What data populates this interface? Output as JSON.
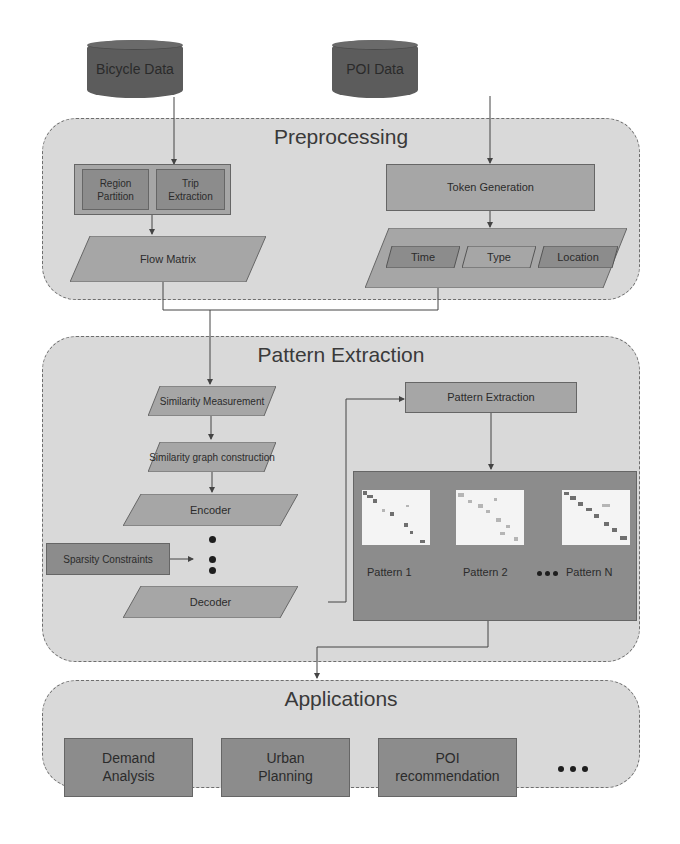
{
  "sources": {
    "bicycle": "Bicycle Data",
    "poi": "POI Data"
  },
  "preprocessing": {
    "title": "Preprocessing",
    "region_partition": "Region Partition",
    "trip_extraction": "Trip Extraction",
    "flow_matrix": "Flow Matrix",
    "token_generation": "Token Generation",
    "tokens": [
      "Time",
      "Type",
      "Location"
    ]
  },
  "pattern_extraction": {
    "title": "Pattern Extraction",
    "steps": [
      "Similarity Measurement",
      "Similarity graph construction",
      "Encoder",
      "Decoder"
    ],
    "sparsity": "Sparsity Constraints",
    "extraction_box": "Pattern Extraction",
    "patterns": [
      "Pattern 1",
      "Pattern 2",
      "Pattern N"
    ]
  },
  "applications": {
    "title": "Applications",
    "items": [
      "Demand Analysis",
      "Urban Planning",
      "POI recommendation"
    ]
  },
  "colors": {
    "panel_bg": "#d9d9d9",
    "box_mid": "#a6a6a6",
    "box_dark": "#8c8c8c",
    "cylinder": "#5c5c5c",
    "line": "#444444"
  }
}
